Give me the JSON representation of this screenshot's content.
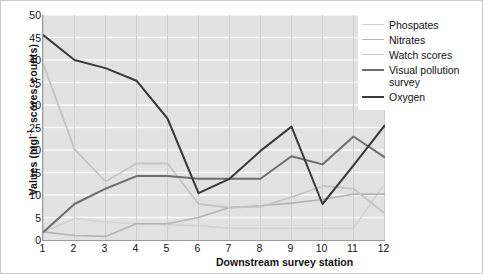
{
  "chart_data": {
    "type": "line",
    "title": "",
    "xlabel": "Downstream survey station",
    "ylabel": "Values (mgl⁻¹, scores, counts)",
    "categories": [
      "1",
      "2",
      "3",
      "4",
      "5",
      "6",
      "7",
      "8",
      "9",
      "10",
      "11",
      "12"
    ],
    "xlim": [
      1,
      12
    ],
    "ylim": [
      0,
      50
    ],
    "yticks": [
      0,
      5,
      10,
      15,
      20,
      25,
      30,
      35,
      40,
      45,
      50
    ],
    "grid": true,
    "legend_position": "top-right",
    "series": [
      {
        "name": "Phospates",
        "color": "#d2d2d2",
        "width": 1.6,
        "values": [
          1.8,
          4.8,
          4.0,
          3.6,
          3.4,
          3.2,
          2.6,
          2.6,
          2.6,
          2.6,
          2.6,
          12.5
        ]
      },
      {
        "name": "Nitrates",
        "color": "#b4b4b4",
        "width": 1.6,
        "values": [
          1.8,
          1.0,
          0.8,
          3.6,
          3.6,
          5.0,
          7.2,
          7.6,
          8.2,
          9.0,
          10.2,
          10.2
        ]
      },
      {
        "name": "Watch scores",
        "color": "#c4c4c4",
        "width": 1.8,
        "values": [
          39.0,
          20.2,
          13.0,
          17.0,
          17.0,
          8.0,
          7.2,
          7.4,
          9.5,
          12.0,
          11.4,
          6.0
        ]
      },
      {
        "name": "Visual pollution survey",
        "color": "#6e6e6e",
        "width": 2.0,
        "values": [
          1.8,
          8.0,
          11.4,
          14.2,
          14.2,
          13.6,
          13.6,
          13.6,
          18.6,
          16.8,
          23.0,
          18.4
        ]
      },
      {
        "name": "Oxygen",
        "color": "#3a3a3a",
        "width": 2.0,
        "values": [
          45.5,
          40.0,
          38.2,
          35.4,
          27.0,
          10.4,
          13.6,
          19.8,
          25.2,
          8.0,
          16.6,
          25.4
        ]
      }
    ]
  },
  "axes": {
    "y_title": "Values (mgl",
    "y_title_sup": "-1",
    "y_title_tail": ", scores, counts)",
    "x_title": "Downstream survey station"
  },
  "legend": {
    "items": [
      {
        "label": "Phospates"
      },
      {
        "label": "Nitrates"
      },
      {
        "label": "Watch scores"
      },
      {
        "label": "Visual pollution\nsurvey"
      },
      {
        "label": "Oxygen"
      }
    ]
  }
}
